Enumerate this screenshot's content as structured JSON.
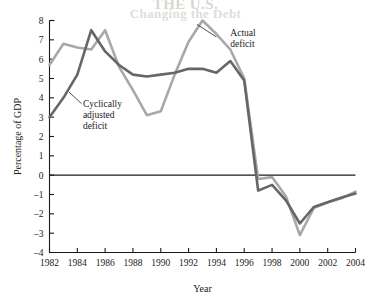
{
  "figure": {
    "background_color": "#ffffff",
    "bleed_text_line1": "THE U.S.",
    "bleed_text_line2": "Changing the Debt"
  },
  "chart_data": {
    "type": "line",
    "title": "",
    "subtitle": "",
    "xlabel": "Year",
    "ylabel": "Percentage of GDP",
    "xlim": [
      1982,
      2004
    ],
    "ylim": [
      -4,
      8
    ],
    "grid": false,
    "legend_position": "inline-annotations",
    "x": [
      1982,
      1983,
      1984,
      1985,
      1986,
      1987,
      1988,
      1989,
      1990,
      1991,
      1992,
      1993,
      1994,
      1995,
      1996,
      1997,
      1998,
      1999,
      2000,
      2001,
      2002,
      2003,
      2004
    ],
    "xticks": [
      1982,
      1984,
      1986,
      1988,
      1990,
      1992,
      1994,
      1996,
      1998,
      2000,
      2002,
      2004
    ],
    "xtick_labels": [
      "1982",
      "1984",
      "1986",
      "1988",
      "1990",
      "1992",
      "1994",
      "1996",
      "1998",
      "2000",
      "2002",
      "2004"
    ],
    "yticks": [
      -4,
      -3,
      -2,
      -1,
      0,
      1,
      2,
      3,
      4,
      5,
      6,
      7,
      8
    ],
    "ytick_labels": [
      "-4",
      "-3",
      "-2",
      "-1",
      "0",
      "1",
      "2",
      "3",
      "4",
      "5",
      "6",
      "7",
      "8"
    ],
    "zero_line": 0,
    "series": [
      {
        "name": "Actual deficit",
        "color": "#a8a8a8",
        "line_width": 2.6,
        "values": [
          5.7,
          6.8,
          6.6,
          6.5,
          7.5,
          5.6,
          4.4,
          3.1,
          3.3,
          5.2,
          6.9,
          8.0,
          7.3,
          6.5,
          5.0,
          -0.2,
          -0.1,
          -1.1,
          -3.1,
          -1.7,
          -1.4,
          -1.2,
          -0.85
        ]
      },
      {
        "name": "Cyclically adjusted deficit",
        "color": "#666666",
        "line_width": 2.6,
        "values": [
          3.0,
          4.0,
          5.2,
          7.5,
          6.4,
          5.7,
          5.2,
          5.1,
          5.2,
          5.3,
          5.5,
          5.5,
          5.3,
          5.9,
          4.9,
          -0.8,
          -0.5,
          -1.3,
          -2.5,
          -1.65,
          -1.4,
          -1.15,
          -0.95
        ]
      }
    ],
    "annotations": [
      {
        "text_lines": [
          "Actual",
          "deficit"
        ],
        "name": "actual-deficit-label",
        "x": 1995.0,
        "y": 7.2,
        "leader_from_x": 1994.0,
        "leader_from_y": 7.15,
        "leader_to_x": 1992.6,
        "leader_to_y": 7.8
      },
      {
        "text_lines": [
          "Cyclically",
          "adjusted",
          "deficit"
        ],
        "name": "cyclically-adjusted-deficit-label",
        "x": 1984.4,
        "y": 3.55,
        "leader_from_x": 1984.3,
        "leader_from_y": 3.7,
        "leader_to_x": 1983.4,
        "leader_to_y": 4.3
      }
    ]
  }
}
